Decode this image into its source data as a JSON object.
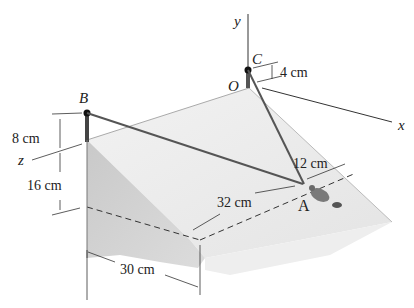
{
  "figure": {
    "type": "statics-3d-diagram",
    "axes": {
      "y": "y",
      "x": "x",
      "z": "z",
      "origin": "O"
    },
    "points": {
      "B": "B",
      "C": "C",
      "A": "A",
      "O": "O"
    },
    "dimensions": {
      "c_height": "4 cm",
      "b_pole": "8 cm",
      "z_to_bottom": "16 cm",
      "depth": "30 cm",
      "slope_length": "32 cm",
      "offset_a": "12 cm"
    },
    "colors": {
      "slope_top": "#e9e9e9",
      "slope_front": "#cfcfcf",
      "cable": "#555555",
      "line": "#333333"
    }
  }
}
